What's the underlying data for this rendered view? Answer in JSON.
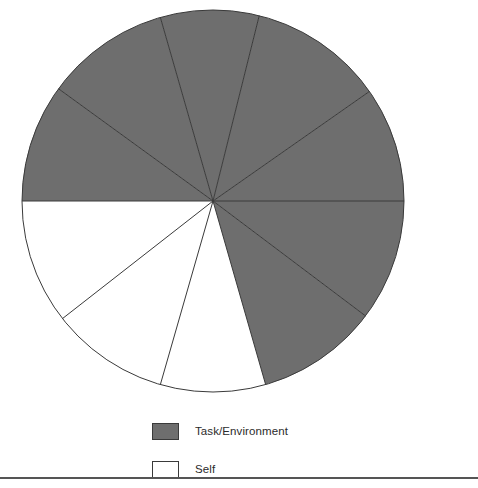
{
  "chart_data": {
    "type": "pie",
    "title": "",
    "center": {
      "x": 213,
      "y": 201
    },
    "radius": 191,
    "grid": false,
    "legend_position": "bottom-left",
    "categories": [
      "Task/Environment",
      "Self"
    ],
    "colors": {
      "task_environment": "#6e6e6e",
      "self": "#ffffff",
      "outline": "#3a3a3a"
    },
    "boundary_angles_deg": [
      0,
      35,
      76,
      106,
      144,
      180,
      218,
      254,
      286,
      323
    ],
    "slices": [
      {
        "label": "Task/Environment",
        "start_angle_deg": 0,
        "end_angle_deg": 35,
        "sweep_deg": 35,
        "value": 9.7,
        "color": "#6e6e6e"
      },
      {
        "label": "Task/Environment",
        "start_angle_deg": 35,
        "end_angle_deg": 76,
        "sweep_deg": 41,
        "value": 11.4,
        "color": "#6e6e6e"
      },
      {
        "label": "Task/Environment",
        "start_angle_deg": 76,
        "end_angle_deg": 106,
        "sweep_deg": 30,
        "value": 8.3,
        "color": "#6e6e6e"
      },
      {
        "label": "Task/Environment",
        "start_angle_deg": 106,
        "end_angle_deg": 144,
        "sweep_deg": 38,
        "value": 10.6,
        "color": "#6e6e6e"
      },
      {
        "label": "Task/Environment",
        "start_angle_deg": 144,
        "end_angle_deg": 180,
        "sweep_deg": 36,
        "value": 10.0,
        "color": "#6e6e6e"
      },
      {
        "label": "Self",
        "start_angle_deg": 180,
        "end_angle_deg": 218,
        "sweep_deg": 38,
        "value": 10.6,
        "color": "#ffffff"
      },
      {
        "label": "Self",
        "start_angle_deg": 218,
        "end_angle_deg": 254,
        "sweep_deg": 36,
        "value": 10.0,
        "color": "#ffffff"
      },
      {
        "label": "Self",
        "start_angle_deg": 254,
        "end_angle_deg": 286,
        "sweep_deg": 32,
        "value": 8.9,
        "color": "#ffffff"
      },
      {
        "label": "Task/Environment",
        "start_angle_deg": 286,
        "end_angle_deg": 323,
        "sweep_deg": 37,
        "value": 10.3,
        "color": "#6e6e6e"
      },
      {
        "label": "Task/Environment",
        "start_angle_deg": 323,
        "end_angle_deg": 360,
        "sweep_deg": 37,
        "value": 10.3,
        "color": "#6e6e6e"
      }
    ],
    "group_totals": [
      {
        "label": "Task/Environment",
        "sweep_deg": 254,
        "percent": 70.6
      },
      {
        "label": "Self",
        "sweep_deg": 106,
        "percent": 29.4
      }
    ]
  },
  "legend": {
    "items": [
      {
        "label": "Task/Environment",
        "color": "#6e6e6e"
      },
      {
        "label": "Self",
        "color": "#ffffff"
      }
    ]
  }
}
